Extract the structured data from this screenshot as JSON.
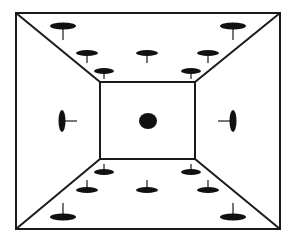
{
  "diagram": {
    "type": "room-perspective-with-pins",
    "colors": {
      "stroke": "#1a1a1a",
      "fill": "#111111",
      "background": "#ffffff"
    },
    "outer_rect": {
      "x": 16,
      "y": 13,
      "w": 264,
      "h": 216
    },
    "inner_rect": {
      "x": 100,
      "y": 82,
      "w": 95,
      "h": 77
    },
    "center_dot": {
      "cx": 148,
      "cy": 121,
      "rx": 9,
      "ry": 8
    },
    "ceiling_pins": [
      {
        "cx": 63,
        "cy": 26,
        "rx": 13,
        "ry": 3.5,
        "stem": 14
      },
      {
        "cx": 87,
        "cy": 53,
        "rx": 11,
        "ry": 3,
        "stem": 10
      },
      {
        "cx": 104,
        "cy": 71,
        "rx": 10,
        "ry": 3,
        "stem": 8
      },
      {
        "cx": 147,
        "cy": 53,
        "rx": 11,
        "ry": 3,
        "stem": 10
      },
      {
        "cx": 191,
        "cy": 71,
        "rx": 10,
        "ry": 3,
        "stem": 8
      },
      {
        "cx": 208,
        "cy": 53,
        "rx": 11,
        "ry": 3,
        "stem": 10
      },
      {
        "cx": 233,
        "cy": 26,
        "rx": 13,
        "ry": 3.5,
        "stem": 14
      }
    ],
    "floor_pins": [
      {
        "cx": 104,
        "cy": 172,
        "rx": 10,
        "ry": 3,
        "stem": 8
      },
      {
        "cx": 87,
        "cy": 190,
        "rx": 11,
        "ry": 3,
        "stem": 10
      },
      {
        "cx": 63,
        "cy": 217,
        "rx": 13,
        "ry": 3.5,
        "stem": 14
      },
      {
        "cx": 147,
        "cy": 190,
        "rx": 11,
        "ry": 3,
        "stem": 10
      },
      {
        "cx": 191,
        "cy": 172,
        "rx": 10,
        "ry": 3,
        "stem": 8
      },
      {
        "cx": 208,
        "cy": 190,
        "rx": 11,
        "ry": 3,
        "stem": 10
      },
      {
        "cx": 233,
        "cy": 217,
        "rx": 13,
        "ry": 3.5,
        "stem": 14
      }
    ],
    "wall_pins": [
      {
        "side": "left",
        "cx": 62,
        "cy": 121,
        "rx": 3.5,
        "ry": 11,
        "stem": 15
      },
      {
        "side": "right",
        "cx": 233,
        "cy": 121,
        "rx": 3.5,
        "ry": 11,
        "stem": 15
      }
    ]
  }
}
